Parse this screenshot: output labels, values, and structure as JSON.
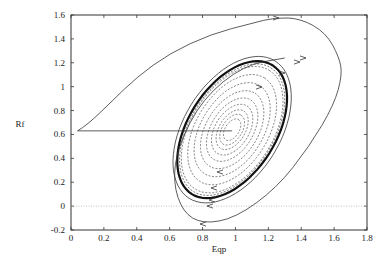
{
  "chart_data": {
    "type": "line",
    "title": "",
    "xlabel": "Eqp",
    "ylabel": "Rf",
    "xlim": [
      0,
      1.8
    ],
    "ylim": [
      -0.2,
      1.6
    ],
    "x_ticks": [
      "0",
      "0.2",
      "0.4",
      "0.6",
      "0.8",
      "1",
      "1.2",
      "1.4",
      "1.6",
      "1.8"
    ],
    "y_ticks": [
      "-0.2",
      "0",
      "0.2",
      "0.4",
      "0.6",
      "0.8",
      "1",
      "1.2",
      "1.4",
      "1.6"
    ],
    "grid": false,
    "legend": null,
    "reference_lines": [
      {
        "type": "horizontal",
        "y": 0,
        "style": "dotted",
        "color": "#aaaaaa"
      }
    ],
    "equilibrium": {
      "x": 0.98,
      "y": 0.64
    },
    "limit_cycle": {
      "style": "thick-solid",
      "approx_extent": {
        "xmin": 0.71,
        "xmax": 1.47,
        "ymin": 0.03,
        "ymax": 1.21
      }
    },
    "series": [
      {
        "name": "outer-trajectory",
        "style": "solid",
        "points": [
          [
            0.04,
            0.63
          ],
          [
            0.1,
            0.68
          ],
          [
            0.25,
            0.88
          ],
          [
            0.4,
            1.08
          ],
          [
            0.6,
            1.28
          ],
          [
            0.85,
            1.44
          ],
          [
            1.1,
            1.53
          ],
          [
            1.24,
            1.58
          ],
          [
            1.4,
            1.57
          ],
          [
            1.55,
            1.45
          ],
          [
            1.63,
            1.25
          ],
          [
            1.65,
            1.1
          ],
          [
            1.6,
            0.85
          ],
          [
            1.45,
            0.5
          ],
          [
            1.25,
            0.15
          ],
          [
            1.0,
            -0.1
          ],
          [
            0.8,
            -0.15
          ],
          [
            0.68,
            -0.05
          ],
          [
            0.62,
            0.2
          ],
          [
            0.65,
            0.5
          ],
          [
            0.8,
            0.9
          ],
          [
            1.05,
            1.18
          ],
          [
            1.3,
            1.24
          ]
        ]
      },
      {
        "name": "initial-segment",
        "style": "solid",
        "points": [
          [
            0.04,
            0.63
          ],
          [
            0.98,
            0.63
          ]
        ]
      },
      {
        "name": "inner-spiral",
        "style": "dashed",
        "description": "trajectory spiralling outward from the equilibrium toward the limit cycle"
      }
    ]
  }
}
